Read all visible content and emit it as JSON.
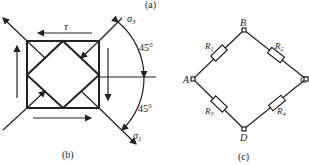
{
  "panel_a": {
    "label": "(a)"
  },
  "panel_b": {
    "label": "(b)",
    "shear_label": "τ",
    "sigma_top": {
      "symbol": "σ",
      "sub": "3"
    },
    "sigma_bottom": {
      "symbol": "σ",
      "sub": "1"
    },
    "angle_top": "45°",
    "angle_bottom": "45°"
  },
  "panel_c": {
    "label": "(c)",
    "nodes": {
      "A": "A",
      "B": "B",
      "C": "C",
      "D": "D"
    },
    "resistors": {
      "R1": {
        "symbol": "R",
        "sub": "1"
      },
      "R2": {
        "symbol": "R",
        "sub": "2"
      },
      "R3": {
        "symbol": "R",
        "sub": "3"
      },
      "R4": {
        "symbol": "R",
        "sub": "4"
      }
    }
  },
  "colors": {
    "line": "#222222",
    "background": "#ffffff"
  }
}
